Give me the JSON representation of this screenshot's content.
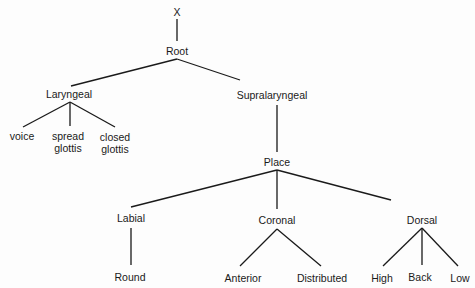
{
  "diagram": {
    "type": "tree",
    "line_color": "#1a1a1a",
    "nodes": {
      "x": {
        "label": "X"
      },
      "root": {
        "label": "Root"
      },
      "laryngeal": {
        "label": "Laryngeal"
      },
      "supralaryngeal": {
        "label": "Supralaryngeal"
      },
      "voice": {
        "label": "voice"
      },
      "spread_glottis": {
        "label_line1": "spread",
        "label_line2": "glottis"
      },
      "closed_glottis": {
        "label_line1": "closed",
        "label_line2": "glottis"
      },
      "place": {
        "label": "Place"
      },
      "labial": {
        "label": "Labial"
      },
      "coronal": {
        "label": "Coronal"
      },
      "dorsal": {
        "label": "Dorsal"
      },
      "round": {
        "label": "Round"
      },
      "anterior": {
        "label": "Anterior"
      },
      "distributed": {
        "label": "Distributed"
      },
      "high": {
        "label": "High"
      },
      "back": {
        "label": "Back"
      },
      "low": {
        "label": "Low"
      }
    },
    "edges": [
      [
        "X",
        "Root"
      ],
      [
        "Root",
        "Laryngeal"
      ],
      [
        "Root",
        "Supralaryngeal"
      ],
      [
        "Laryngeal",
        "voice"
      ],
      [
        "Laryngeal",
        "spread glottis"
      ],
      [
        "Laryngeal",
        "closed glottis"
      ],
      [
        "Supralaryngeal",
        "Place"
      ],
      [
        "Place",
        "Labial"
      ],
      [
        "Place",
        "Coronal"
      ],
      [
        "Place",
        "Dorsal"
      ],
      [
        "Labial",
        "Round"
      ],
      [
        "Coronal",
        "Anterior"
      ],
      [
        "Coronal",
        "Distributed"
      ],
      [
        "Dorsal",
        "High"
      ],
      [
        "Dorsal",
        "Back"
      ],
      [
        "Dorsal",
        "Low"
      ]
    ]
  }
}
